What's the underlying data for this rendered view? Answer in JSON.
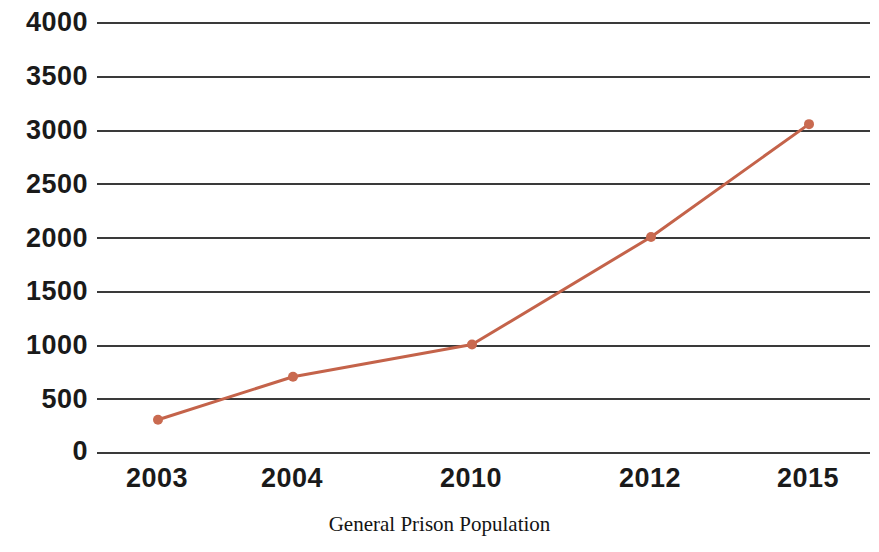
{
  "chart_data": {
    "type": "line",
    "title": "",
    "subtitle": "",
    "xlabel": "General Prison Population",
    "ylabel": "",
    "categories": [
      "2003",
      "2004",
      "2010",
      "2012",
      "2015"
    ],
    "values": [
      300,
      700,
      1000,
      2000,
      3050
    ],
    "series": [
      {
        "name": "General Prison Population",
        "values": [
          300,
          700,
          1000,
          2000,
          3050
        ]
      }
    ],
    "ylim": [
      0,
      4000
    ],
    "y_ticks": [
      4000,
      3500,
      3000,
      2500,
      2000,
      1500,
      1000,
      500,
      0
    ],
    "y_tick_labels": [
      "4000",
      "3500",
      "3000",
      "2500",
      "2000",
      "1500",
      "1000",
      "500",
      "0"
    ],
    "x_tick_labels": [
      "2003",
      "2004",
      "2010",
      "2012",
      "2015"
    ],
    "grid": true,
    "grid_axis": "y",
    "legend": false,
    "legend_position": "none",
    "annotations": [],
    "colors": {
      "line": "#C4634A",
      "marker": "#C96A50",
      "gridline": "#3A3A3A",
      "axis_text": "#1A1A1A",
      "axis_title_text": "#141414",
      "background": "#FFFFFF"
    },
    "marker": {
      "shape": "circle",
      "radius": 5
    },
    "line_width": 3
  }
}
